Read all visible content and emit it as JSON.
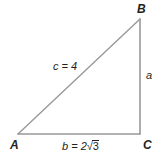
{
  "figure": {
    "type": "right-triangle-diagram",
    "background_color": "#ffffff",
    "stroke_color": "#999999",
    "text_color": "#231f20"
  },
  "vertices": {
    "a": {
      "label": "A",
      "x": 18,
      "y": 134
    },
    "b": {
      "label": "B",
      "x": 140,
      "y": 19
    },
    "c": {
      "label": "C",
      "x": 140,
      "y": 134
    }
  },
  "sides": {
    "hypotenuse": {
      "label": "c = 4",
      "name": "c",
      "value": "4"
    },
    "vertical": {
      "label": "a",
      "name": "a",
      "value": ""
    },
    "base_prefix": "b = 2",
    "base_radical_sign": "√",
    "base_radicand": "3",
    "base_full": "b = 2√3"
  }
}
